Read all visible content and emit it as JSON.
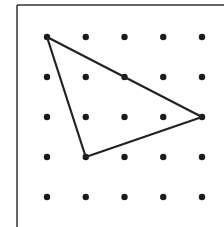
{
  "diagram": {
    "type": "geoboard-dot-grid",
    "grid": {
      "rows": 5,
      "cols": 5,
      "origin_px": [
        47,
        37
      ],
      "spacing_px": [
        38.75,
        40
      ],
      "dot_radius": 3.2,
      "dot_color": "#1a1a1a"
    },
    "frame": {
      "left": 17,
      "top": 5,
      "color": "#333333"
    },
    "triangle": {
      "vertices_grid": [
        [
          0,
          0
        ],
        [
          4,
          2
        ],
        [
          1,
          3
        ]
      ],
      "stroke": "#222222",
      "stroke_width": 2.2
    }
  }
}
